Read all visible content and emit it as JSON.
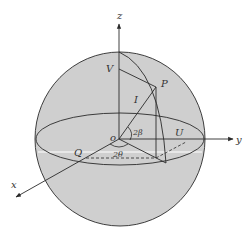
{
  "colors": {
    "sphere_fill": "#cfcfcf",
    "line": "#2a2a2a",
    "highlight": "#ffffff",
    "background": "#ffffff"
  },
  "labels": {
    "z_axis": "z",
    "y_axis": "y",
    "x_axis": "x",
    "origin": "o",
    "point_v": "V",
    "point_p": "P",
    "intensity": "I",
    "point_u": "U",
    "point_q": "Q",
    "angle_beta": "2β",
    "angle_theta": "2θ"
  }
}
